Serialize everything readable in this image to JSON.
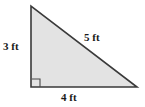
{
  "figure": {
    "name": "right-triangle-diagram",
    "shape": "right triangle",
    "fill_color": "#e3e3e3",
    "stroke_color": "#3a3a3a",
    "background_color": "#ffffff",
    "right_angle_marker": "right-angle-square",
    "vertices": {
      "apex": [
        31,
        6
      ],
      "right_angle": [
        31,
        87
      ],
      "base_right": [
        137,
        87
      ]
    },
    "labels": {
      "vertical_leg": "3 ft",
      "hypotenuse": "5 ft",
      "horizontal_leg": "4 ft"
    }
  },
  "chart_data": {
    "type": "diagram",
    "title": "",
    "shape": "right triangle",
    "sides": [
      {
        "name": "vertical leg",
        "label": "3 ft",
        "value": 3,
        "unit": "ft"
      },
      {
        "name": "hypotenuse",
        "label": "5 ft",
        "value": 5,
        "unit": "ft"
      },
      {
        "name": "horizontal leg",
        "label": "4 ft",
        "value": 4,
        "unit": "ft"
      }
    ],
    "annotations": [
      "right angle at bottom-left vertex"
    ]
  }
}
